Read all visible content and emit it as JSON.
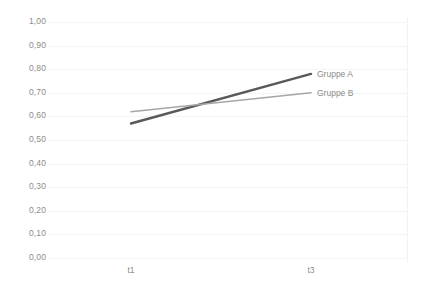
{
  "chart_data": {
    "type": "line",
    "title": "",
    "xlabel": "",
    "ylabel": "",
    "categories": [
      "t1",
      "t3"
    ],
    "x_tick_labels": [
      "t1",
      "t3"
    ],
    "y_tick_labels": [
      "0,00",
      "0,10",
      "0,20",
      "0,30",
      "0,40",
      "0,50",
      "0,60",
      "0,70",
      "0,80",
      "0,90",
      "1,00"
    ],
    "y_tick_values": [
      0.0,
      0.1,
      0.2,
      0.3,
      0.4,
      0.5,
      0.6,
      0.7,
      0.8,
      0.9,
      1.0
    ],
    "ylim": [
      0.0,
      1.0
    ],
    "grid": true,
    "legend_position": "inline-right",
    "decimal_separator": ",",
    "series": [
      {
        "name": "Gruppe A",
        "values": [
          0.57,
          0.78
        ],
        "color": "#595959",
        "line_width": 2.4
      },
      {
        "name": "Gruppe B",
        "values": [
          0.62,
          0.7
        ],
        "color": "#a6a6a6",
        "line_width": 1.5
      }
    ]
  },
  "legend": {
    "items": [
      {
        "label": "Gruppe A",
        "color": "#595959"
      },
      {
        "label": "Gruppe B",
        "color": "#a6a6a6"
      }
    ]
  }
}
